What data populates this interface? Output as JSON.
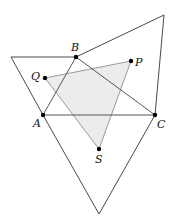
{
  "diagram": {
    "colors": {
      "outer_stroke": "#4a4a4a",
      "abc_stroke": "#555555",
      "pqs_stroke": "#9a9a9a",
      "pqs_fill": "#ececec",
      "point": "#000000"
    },
    "points": {
      "A": {
        "x": 43,
        "y": 115,
        "label": "A"
      },
      "B": {
        "x": 76,
        "y": 57,
        "label": "B"
      },
      "C": {
        "x": 155,
        "y": 115,
        "label": "C"
      },
      "P": {
        "x": 131,
        "y": 61,
        "label": "P"
      },
      "Q": {
        "x": 45,
        "y": 78,
        "label": "Q"
      },
      "S": {
        "x": 99,
        "y": 149,
        "label": "S"
      }
    },
    "outer_vertices": {
      "left": {
        "x": 11,
        "y": 57
      },
      "top_right": {
        "x": 164,
        "y": 15
      },
      "bottom": {
        "x": 99,
        "y": 214
      }
    },
    "triangles": [
      {
        "name": "ABC",
        "vertices": [
          "A",
          "B",
          "C"
        ]
      },
      {
        "name": "PQS",
        "vertices": [
          "P",
          "Q",
          "S"
        ],
        "shaded": true
      },
      {
        "name": "outer-on-AB",
        "vertices": [
          "A",
          "B",
          "left"
        ]
      },
      {
        "name": "outer-on-BC",
        "vertices": [
          "B",
          "C",
          "top_right"
        ]
      },
      {
        "name": "outer-on-CA",
        "vertices": [
          "C",
          "A",
          "bottom"
        ]
      }
    ]
  }
}
